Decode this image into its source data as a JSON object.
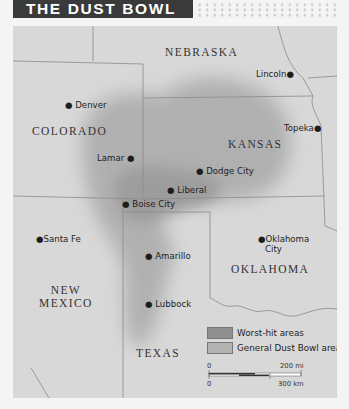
{
  "title": "THE DUST BOWL",
  "colors": {
    "title_bg": "#3a3a3a",
    "land": "#d8d8d8",
    "general_area": "#b7b7b7",
    "worst_hit": "#9b9b9b",
    "border": "#8a8a8a"
  },
  "states": [
    {
      "name": "NEBRASKA"
    },
    {
      "name": "COLORADO"
    },
    {
      "name": "KANSAS"
    },
    {
      "name": "NEW MEXICO",
      "line1": "NEW",
      "line2": "MEXICO"
    },
    {
      "name": "OKLAHOMA"
    },
    {
      "name": "TEXAS"
    }
  ],
  "cities": [
    {
      "name": "Denver"
    },
    {
      "name": "Lincoln"
    },
    {
      "name": "Topeka"
    },
    {
      "name": "Lamar"
    },
    {
      "name": "Dodge City"
    },
    {
      "name": "Liberal"
    },
    {
      "name": "Boise City"
    },
    {
      "name": "Santa Fe"
    },
    {
      "name": "Amarillo"
    },
    {
      "name": "Oklahoma City",
      "line1": "Oklahoma",
      "line2": "City"
    },
    {
      "name": "Lubbock"
    }
  ],
  "legend": {
    "items": [
      {
        "label": "Worst-hit areas",
        "color": "#8f8f8f"
      },
      {
        "label": "General Dust Bowl area",
        "color": "#b2b2b2"
      }
    ],
    "scale": {
      "zero_mi": "0",
      "mi_label": "200 mi",
      "zero_km": "0",
      "km_label": "300 km"
    }
  }
}
